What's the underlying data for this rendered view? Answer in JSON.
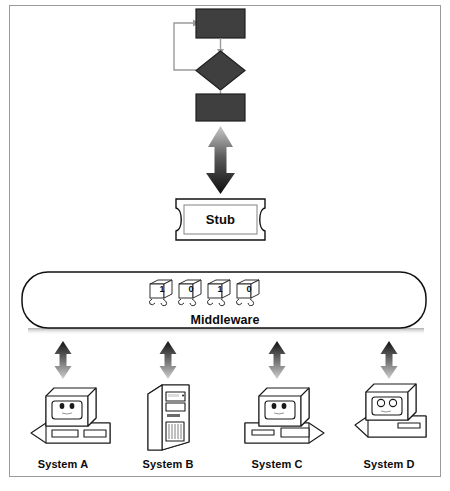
{
  "diagram": {
    "title_visible": false,
    "frame": {
      "border_color": "#9a9a9a",
      "background": "#ffffff"
    },
    "palette": {
      "shape_fill": "#3f3f3f",
      "shape_stroke": "#1a1a1a",
      "line": "#8a8a8a",
      "text": "#0b0b0b",
      "arrow_dark": "#141414",
      "arrow_light": "#d2d2d2",
      "shadow": "#b9b9b9"
    },
    "flowchart": {
      "name": "process-flowchart",
      "nodes": [
        {
          "id": "top-process",
          "shape": "rectangle",
          "label": ""
        },
        {
          "id": "decision",
          "shape": "diamond",
          "label": ""
        },
        {
          "id": "bottom-process",
          "shape": "rectangle",
          "label": ""
        }
      ],
      "connectors": [
        {
          "from": "top-process",
          "to": "decision",
          "type": "arrow-down"
        },
        {
          "from": "decision",
          "to": "bottom-process",
          "type": "arrow-down"
        },
        {
          "from": "decision",
          "to": "top-process",
          "type": "feedback-loop-left"
        }
      ]
    },
    "bidirectional_main_arrow": {
      "name": "stub-to-flowchart-arrow",
      "direction": "both",
      "orientation": "vertical"
    },
    "stub": {
      "name": "stub-node",
      "label": "Stub",
      "shape": "notched-rectangle"
    },
    "middleware": {
      "name": "middleware-bar",
      "label": "Middleware",
      "shape": "rounded-bar",
      "packets": [
        {
          "id": "packet-1",
          "digit": "1"
        },
        {
          "id": "packet-2",
          "digit": "0"
        },
        {
          "id": "packet-3",
          "digit": "1"
        },
        {
          "id": "packet-4",
          "digit": "0"
        }
      ]
    },
    "system_links": [
      {
        "name": "link-system-a",
        "direction": "both"
      },
      {
        "name": "link-system-b",
        "direction": "both"
      },
      {
        "name": "link-system-c",
        "direction": "both"
      },
      {
        "name": "link-system-d",
        "direction": "both"
      }
    ],
    "systems": [
      {
        "id": "system-a",
        "label": "System A",
        "icon": "desktop-computer-icon"
      },
      {
        "id": "system-b",
        "label": "System B",
        "icon": "tower-server-icon"
      },
      {
        "id": "system-c",
        "label": "System C",
        "icon": "desktop-computer-icon"
      },
      {
        "id": "system-d",
        "label": "System D",
        "icon": "desktop-computer-icon"
      }
    ]
  }
}
